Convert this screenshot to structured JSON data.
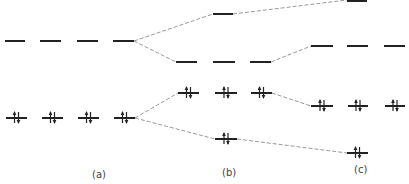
{
  "diagram": {
    "type": "energy-level-splitting",
    "colors": {
      "level": "#222222",
      "connector": "#999999",
      "text": "#444444"
    },
    "columns": [
      {
        "id": "a",
        "label": "(a)",
        "label_pos": [
          92,
          178
        ],
        "levels": [
          {
            "y": 41,
            "segments": [
              [
                5,
                25
              ],
              [
                40,
                61
              ],
              [
                77,
                98
              ],
              [
                113,
                134
              ]
            ],
            "electrons": "empty"
          },
          {
            "y": 118,
            "segments": [
              [
                6,
                27
              ],
              [
                42,
                63
              ],
              [
                78,
                99
              ],
              [
                114,
                135
              ]
            ],
            "electrons": "paired"
          }
        ]
      },
      {
        "id": "b",
        "label": "(b)",
        "label_pos": [
          222,
          176
        ],
        "levels": [
          {
            "y": 14,
            "segments": [
              [
                213,
                233
              ]
            ],
            "electrons": "empty"
          },
          {
            "y": 62,
            "segments": [
              [
                176,
                197
              ],
              [
                213,
                235
              ],
              [
                250,
                271
              ]
            ],
            "electrons": "empty"
          },
          {
            "y": 93,
            "segments": [
              [
                178,
                199
              ],
              [
                215,
                237
              ],
              [
                251,
                272
              ]
            ],
            "electrons": "paired"
          },
          {
            "y": 139,
            "segments": [
              [
                215,
                237
              ]
            ],
            "electrons": "paired"
          }
        ]
      },
      {
        "id": "c",
        "label": "(c)",
        "label_pos": [
          354,
          173
        ],
        "levels": [
          {
            "y": 0,
            "segments": [
              [
                347,
                367
              ]
            ],
            "electrons": "empty"
          },
          {
            "y": 46,
            "segments": [
              [
                311,
                333
              ],
              [
                347,
                368
              ],
              [
                384,
                405
              ]
            ],
            "electrons": "empty"
          },
          {
            "y": 106,
            "segments": [
              [
                311,
                333
              ],
              [
                348,
                368
              ],
              [
                385,
                405
              ]
            ],
            "electrons": "paired"
          },
          {
            "y": 153,
            "segments": [
              [
                347,
                368
              ]
            ],
            "electrons": "paired"
          }
        ]
      }
    ],
    "connectors": [
      {
        "from": [
          134,
          41
        ],
        "to": [
          213,
          14
        ]
      },
      {
        "from": [
          134,
          41
        ],
        "to": [
          176,
          62
        ]
      },
      {
        "from": [
          233,
          14
        ],
        "to": [
          347,
          0
        ]
      },
      {
        "from": [
          271,
          62
        ],
        "to": [
          311,
          46
        ]
      },
      {
        "from": [
          135,
          118
        ],
        "to": [
          178,
          93
        ]
      },
      {
        "from": [
          135,
          118
        ],
        "to": [
          215,
          139
        ]
      },
      {
        "from": [
          272,
          93
        ],
        "to": [
          311,
          106
        ]
      },
      {
        "from": [
          237,
          139
        ],
        "to": [
          347,
          153
        ]
      }
    ]
  }
}
